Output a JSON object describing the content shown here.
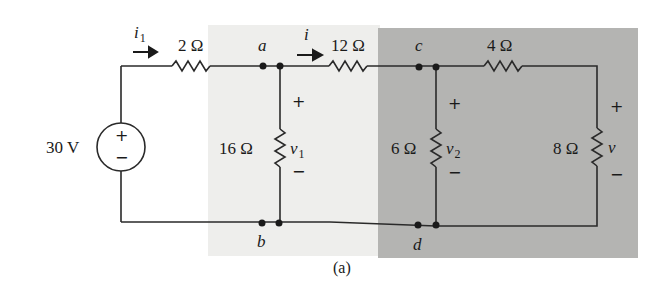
{
  "figure": {
    "caption": "(a)",
    "colors": {
      "background": "#ffffff",
      "light_region": "#eeeeec",
      "dark_region": "#b4b4b2",
      "wire": "#2a2a2a",
      "text": "#1a1a1a"
    }
  },
  "source": {
    "label": "30 V",
    "plus": "+",
    "minus": "−"
  },
  "currents": [
    {
      "symbol": "i",
      "subscript": "1"
    },
    {
      "symbol": "i",
      "subscript": ""
    }
  ],
  "resistors": [
    {
      "id": "r2",
      "label": "2 Ω"
    },
    {
      "id": "r12",
      "label": "12 Ω"
    },
    {
      "id": "r4",
      "label": "4 Ω"
    },
    {
      "id": "r16",
      "label": "16 Ω"
    },
    {
      "id": "r6",
      "label": "6 Ω"
    },
    {
      "id": "r8",
      "label": "8 Ω"
    }
  ],
  "voltages": [
    {
      "symbol": "v",
      "subscript": "1",
      "plus": "+",
      "minus": "−"
    },
    {
      "symbol": "v",
      "subscript": "2",
      "plus": "+",
      "minus": "−"
    },
    {
      "symbol": "v",
      "subscript": "",
      "plus": "+",
      "minus": "−"
    }
  ],
  "nodes": [
    "a",
    "b",
    "c",
    "d"
  ]
}
